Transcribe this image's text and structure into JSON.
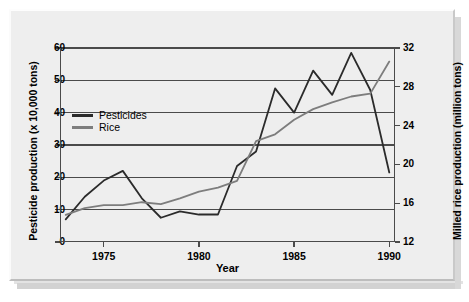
{
  "figure": {
    "background_color": "#eeeeee",
    "axis_color": "#4a4a4a"
  },
  "chart_data": {
    "type": "line",
    "title": "",
    "xlabel": "Year",
    "ylabel": "Pesticide production (x 10,000 tons)",
    "ylabel_secondary": "Milled rice production (million tons)",
    "grid": true,
    "legend_position": "inside-left",
    "x": [
      1973,
      1974,
      1975,
      1976,
      1977,
      1978,
      1979,
      1980,
      1981,
      1982,
      1983,
      1984,
      1985,
      1986,
      1987,
      1988,
      1989,
      1990
    ],
    "xlim": [
      1972.7,
      1990.3
    ],
    "xticks": [
      1975,
      1980,
      1985,
      1990
    ],
    "xticklabels": [
      "1975",
      "1980",
      "1985",
      "1990"
    ],
    "ylim": [
      0,
      60
    ],
    "yticks": [
      0,
      10,
      20,
      30,
      40,
      50,
      60
    ],
    "yticklabels": [
      "0",
      "10",
      "20",
      "30",
      "40",
      "50",
      "60"
    ],
    "ylim_secondary": [
      12,
      32
    ],
    "yticks_secondary": [
      12,
      16,
      20,
      24,
      28,
      32
    ],
    "yticklabels_secondary": [
      "12",
      "16",
      "20",
      "24",
      "28",
      "32"
    ],
    "series": [
      {
        "name": "Pesticides",
        "axis": "left",
        "color": "#2b2b2b",
        "unit": "x 10,000 tons",
        "values": [
          7.0,
          14.0,
          19.0,
          22.0,
          13.5,
          7.5,
          9.5,
          8.5,
          8.5,
          23.5,
          28.0,
          47.5,
          40.0,
          53.0,
          45.5,
          58.5,
          47.0,
          21.5
        ]
      },
      {
        "name": "Rice",
        "axis": "right",
        "color": "#7d7d7d",
        "unit": "million tons",
        "values": [
          14.8,
          15.5,
          15.8,
          15.8,
          16.1,
          15.9,
          16.5,
          17.2,
          17.6,
          18.3,
          22.4,
          23.1,
          24.6,
          25.7,
          26.4,
          27.0,
          27.3,
          30.6
        ]
      }
    ]
  },
  "legend": {
    "items": [
      {
        "label": "Pesticides",
        "color": "#2b2b2b"
      },
      {
        "label": "Rice",
        "color": "#7d7d7d"
      }
    ]
  }
}
